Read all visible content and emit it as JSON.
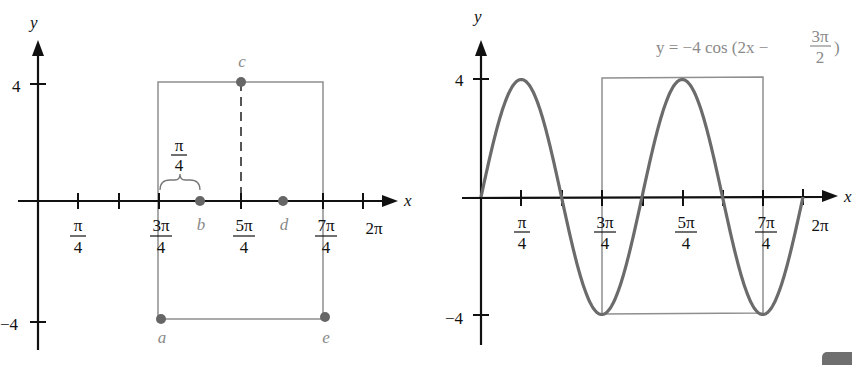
{
  "left_panel": {
    "axis_labels": {
      "x": "x",
      "y": "y"
    },
    "y_ticks": [
      {
        "label": "4",
        "value": 4
      },
      {
        "label": "−4",
        "value": -4
      }
    ],
    "x_ticks": [
      {
        "num": "π",
        "den": "4",
        "value": "π/4"
      },
      {
        "num": "",
        "den": "",
        "value": "π/2"
      },
      {
        "num": "3π",
        "den": "4",
        "value": "3π/4"
      },
      {
        "num": "5π",
        "den": "4",
        "value": "5π/4"
      },
      {
        "num": "7π",
        "den": "4",
        "value": "7π/4"
      },
      {
        "num": "2π",
        "den": "",
        "value": "2π"
      }
    ],
    "brace_label": {
      "num": "π",
      "den": "4"
    },
    "points": [
      {
        "name": "a",
        "x": "3π/4",
        "y": -4
      },
      {
        "name": "b",
        "x": "π",
        "y": 0
      },
      {
        "name": "c",
        "x": "5π/4",
        "y": 4
      },
      {
        "name": "d",
        "x": "3π/2",
        "y": 0
      },
      {
        "name": "e",
        "x": "7π/4",
        "y": -4
      }
    ],
    "box": {
      "x_from": "3π/4",
      "x_to": "7π/4",
      "y_from": -4,
      "y_to": 4
    }
  },
  "right_panel": {
    "axis_labels": {
      "x": "x",
      "y": "y"
    },
    "equation": {
      "prefix": "y = −4 cos (2x − ",
      "num": "3π",
      "den": "2",
      "suffix": ")"
    },
    "y_ticks": [
      {
        "label": "4",
        "value": 4
      },
      {
        "label": "−4",
        "value": -4
      }
    ],
    "x_ticks": [
      {
        "num": "π",
        "den": "4"
      },
      {
        "num": "3π",
        "den": "4"
      },
      {
        "num": "5π",
        "den": "4"
      },
      {
        "num": "7π",
        "den": "4"
      },
      {
        "num": "2π",
        "den": ""
      }
    ],
    "box": {
      "x_from": "3π/4",
      "x_to": "7π/4",
      "y_from": -4,
      "y_to": 4
    }
  },
  "chart_data": {
    "type": "line",
    "xlabel": "x",
    "ylabel": "y",
    "xlim": [
      0,
      6.2832
    ],
    "ylim": [
      -4,
      4
    ],
    "x_tick_labels": [
      "π/4",
      "3π/4",
      "5π/4",
      "7π/4",
      "2π"
    ],
    "y_tick_labels": [
      "4",
      "−4"
    ],
    "series": [
      {
        "name": "y = −4 cos(2x − 3π/2)",
        "x": [
          "0",
          "π/4",
          "π/2",
          "3π/4",
          "π",
          "5π/4",
          "3π/2",
          "7π/4",
          "2π"
        ],
        "values": [
          0,
          4,
          0,
          -4,
          0,
          4,
          0,
          -4,
          0
        ]
      }
    ],
    "key_points": {
      "a": [
        "3π/4",
        -4
      ],
      "b": [
        "π",
        0
      ],
      "c": [
        "5π/4",
        4
      ],
      "d": [
        "3π/2",
        0
      ],
      "e": [
        "7π/4",
        -4
      ]
    },
    "amplitude": 4,
    "period": "π",
    "grid": false
  }
}
